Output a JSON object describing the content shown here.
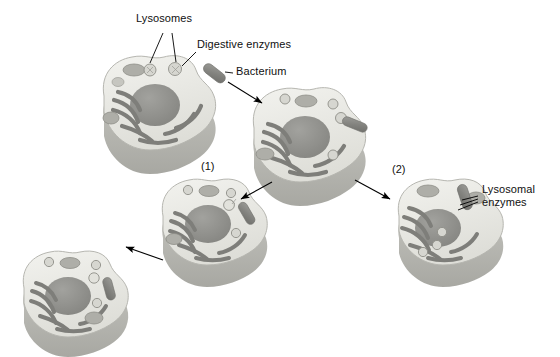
{
  "figure": {
    "type": "biology-process-diagram",
    "colors": {
      "cytoplasm": "#e9e9e5",
      "cytoplasm_edge": "#cfcfc9",
      "cut_face": "#b4b4ae",
      "nucleus": "#8e8e8a",
      "er": "#7e7e7a",
      "organelle": "#a8a8a2",
      "bacterium": "#8a8a86",
      "outline": "#9a9a94",
      "text": "#101010",
      "arrow": "#000000",
      "background": "#ffffff"
    }
  },
  "labels": {
    "lysosomes": "Lysosomes",
    "digestive_enzymes": "Digestive enzymes",
    "bacterium": "Bacterium",
    "lysosomal_enzymes_line1": "Lysosomal",
    "lysosomal_enzymes_line2": "enzymes"
  },
  "steps": {
    "one": "(1)",
    "two": "(2)"
  },
  "cells": [
    {
      "id": "cell-initial",
      "caption": "",
      "description": "Resting cell with nucleus, endoplasmic reticulum, mitochondria and lysosomes"
    },
    {
      "id": "cell-contact",
      "caption": "",
      "description": "Bacterium contacting the cell membrane, beginning engulfment"
    },
    {
      "id": "cell-step-1",
      "caption": "(1)",
      "description": "Bacterium enclosed in a phagocytic vacuole inside the cell"
    },
    {
      "id": "cell-step-2",
      "caption": "(2)",
      "description": "Lysosome fuses with the vacuole releasing lysosomal enzymes"
    },
    {
      "id": "cell-final",
      "caption": "",
      "description": "Digested bacterium within the phagolysosome"
    }
  ]
}
